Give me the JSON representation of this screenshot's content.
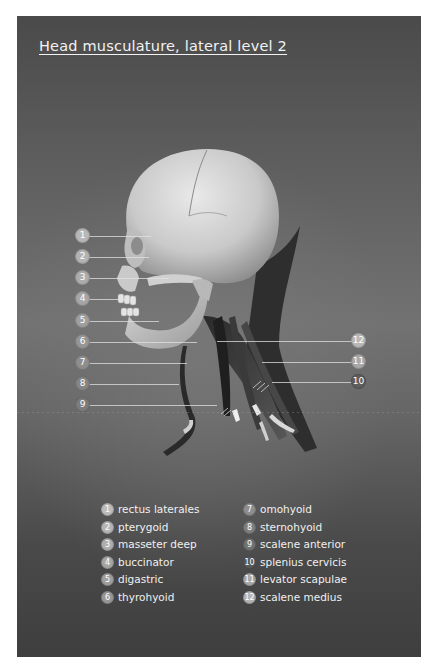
{
  "title": "Head musculature, lateral level 2",
  "badge_colors": {
    "light": "#b8b8b8",
    "mid": "#9a9a9a",
    "dark": "#6a6a6a"
  },
  "callouts_left": [
    {
      "number": "1"
    },
    {
      "number": "2"
    },
    {
      "number": "3"
    },
    {
      "number": "4"
    },
    {
      "number": "5"
    },
    {
      "number": "6"
    },
    {
      "number": "7"
    },
    {
      "number": "8"
    },
    {
      "number": "9"
    }
  ],
  "callouts_right": [
    {
      "number": "12"
    },
    {
      "number": "11"
    },
    {
      "number": "10"
    }
  ],
  "legend": {
    "left_column": [
      {
        "number": "1",
        "label": "rectus laterales"
      },
      {
        "number": "2",
        "label": "pterygoid"
      },
      {
        "number": "3",
        "label": "masseter deep"
      },
      {
        "number": "4",
        "label": "buccinator"
      },
      {
        "number": "5",
        "label": "digastric"
      },
      {
        "number": "6",
        "label": "thyrohyoid"
      }
    ],
    "right_column": [
      {
        "number": "7",
        "label": "omohyoid"
      },
      {
        "number": "8",
        "label": "sternohyoid"
      },
      {
        "number": "9",
        "label": "scalene anterior"
      },
      {
        "number": "10",
        "label": "splenius cervicis"
      },
      {
        "number": "11",
        "label": "levator scapulae"
      },
      {
        "number": "12",
        "label": "scalene medius"
      }
    ]
  }
}
